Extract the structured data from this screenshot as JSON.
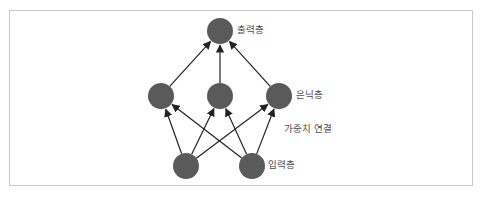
{
  "diagram": {
    "type": "neural-network",
    "colors": {
      "node": "#5a5a5a",
      "edge": "#222222",
      "frame": "#c8c8c8",
      "label": "#4a4a4a"
    },
    "node_radius": 13,
    "layers": [
      {
        "id": "output",
        "label": "출력층",
        "nodes": [
          {
            "x": 220,
            "y": 31
          }
        ]
      },
      {
        "id": "hidden",
        "label": "은닉층",
        "nodes": [
          {
            "x": 161,
            "y": 96
          },
          {
            "x": 220,
            "y": 96
          },
          {
            "x": 279,
            "y": 96
          }
        ]
      },
      {
        "id": "input",
        "label": "입력층",
        "nodes": [
          {
            "x": 186,
            "y": 166
          },
          {
            "x": 252,
            "y": 166
          }
        ]
      }
    ],
    "connections_label": "가중치 연결",
    "edges": [
      {
        "from": [
          186,
          166
        ],
        "to": [
          161,
          96
        ]
      },
      {
        "from": [
          186,
          166
        ],
        "to": [
          220,
          96
        ]
      },
      {
        "from": [
          186,
          166
        ],
        "to": [
          279,
          96
        ]
      },
      {
        "from": [
          252,
          166
        ],
        "to": [
          161,
          96
        ]
      },
      {
        "from": [
          252,
          166
        ],
        "to": [
          220,
          96
        ]
      },
      {
        "from": [
          252,
          166
        ],
        "to": [
          279,
          96
        ]
      },
      {
        "from": [
          161,
          96
        ],
        "to": [
          220,
          31
        ]
      },
      {
        "from": [
          220,
          96
        ],
        "to": [
          220,
          31
        ]
      },
      {
        "from": [
          279,
          96
        ],
        "to": [
          220,
          31
        ]
      }
    ]
  },
  "labels": {
    "output_layer": "출력층",
    "hidden_layer": "은닉층",
    "weighted_connections": "가중치 연결",
    "input_layer": "입력층"
  }
}
